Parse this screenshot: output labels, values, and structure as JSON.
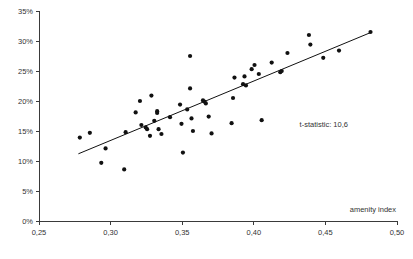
{
  "chart_data": {
    "type": "scatter",
    "title": "",
    "xlabel": "amenity index",
    "ylabel": "",
    "xlim": [
      0.25,
      0.5
    ],
    "ylim": [
      0,
      35
    ],
    "grid": false,
    "legend": "none",
    "x_ticks": [
      "0,25",
      "0,30",
      "0,35",
      "0,40",
      "0,45",
      "0,50"
    ],
    "x_tick_values": [
      0.25,
      0.3,
      0.35,
      0.4,
      0.45,
      0.5
    ],
    "y_ticks": [
      "0%",
      "5%",
      "10%",
      "15%",
      "20%",
      "25%",
      "30%",
      "35%"
    ],
    "y_tick_values": [
      0,
      5,
      10,
      15,
      20,
      25,
      30,
      35
    ],
    "annotations": [
      {
        "name": "t-statistic-annotation",
        "text": "t-statistic: 10,6",
        "x": 0.432,
        "y": 15.6
      }
    ],
    "trend_line": {
      "name": "regression-line",
      "x_start": 0.2775,
      "y_start": 11.2,
      "x_end": 0.4825,
      "y_end": 31.5
    },
    "series": [
      {
        "name": "observations",
        "marker": "circle",
        "color": "#111111",
        "points": [
          [
            0.2785,
            13.9
          ],
          [
            0.2855,
            14.7
          ],
          [
            0.2935,
            9.7
          ],
          [
            0.2965,
            12.1
          ],
          [
            0.3095,
            8.6
          ],
          [
            0.3105,
            14.8
          ],
          [
            0.3175,
            18.1
          ],
          [
            0.3205,
            20.0
          ],
          [
            0.3215,
            16.0
          ],
          [
            0.3245,
            15.6
          ],
          [
            0.3255,
            15.3
          ],
          [
            0.3275,
            14.2
          ],
          [
            0.3285,
            20.9
          ],
          [
            0.3305,
            16.7
          ],
          [
            0.3325,
            18.3
          ],
          [
            0.3325,
            18.0
          ],
          [
            0.3335,
            15.3
          ],
          [
            0.3355,
            14.5
          ],
          [
            0.3415,
            17.3
          ],
          [
            0.3485,
            19.4
          ],
          [
            0.3495,
            16.2
          ],
          [
            0.3505,
            11.4
          ],
          [
            0.3535,
            18.6
          ],
          [
            0.3555,
            22.1
          ],
          [
            0.3555,
            27.5
          ],
          [
            0.3565,
            17.1
          ],
          [
            0.3575,
            15.0
          ],
          [
            0.3645,
            20.1
          ],
          [
            0.3655,
            19.9
          ],
          [
            0.3665,
            19.6
          ],
          [
            0.3685,
            17.4
          ],
          [
            0.3705,
            14.6
          ],
          [
            0.3845,
            16.3
          ],
          [
            0.3855,
            20.5
          ],
          [
            0.3865,
            23.9
          ],
          [
            0.3925,
            22.8
          ],
          [
            0.3935,
            24.1
          ],
          [
            0.3945,
            22.6
          ],
          [
            0.3985,
            25.3
          ],
          [
            0.4005,
            26.0
          ],
          [
            0.4035,
            24.5
          ],
          [
            0.4055,
            16.8
          ],
          [
            0.4125,
            26.4
          ],
          [
            0.4185,
            24.8
          ],
          [
            0.4195,
            25.0
          ],
          [
            0.4235,
            28.0
          ],
          [
            0.4385,
            31.0
          ],
          [
            0.4395,
            29.4
          ],
          [
            0.4485,
            27.2
          ],
          [
            0.4595,
            28.4
          ],
          [
            0.4815,
            31.5
          ]
        ]
      }
    ]
  },
  "geometry": {
    "plot_left": 39,
    "plot_right": 397,
    "plot_top": 11,
    "plot_bottom": 221,
    "point_radius": 2.1
  }
}
